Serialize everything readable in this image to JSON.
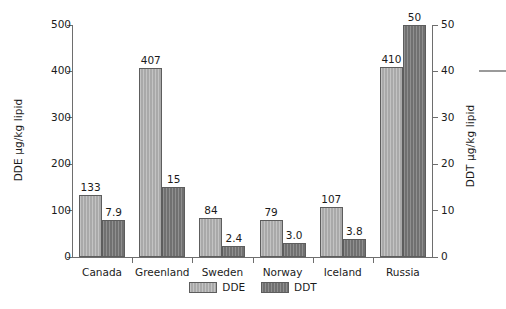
{
  "chart_data": {
    "type": "bar",
    "title": "",
    "xlabel": "",
    "categories": [
      "Canada",
      "Greenland",
      "Sweden",
      "Norway",
      "Iceland",
      "Russia"
    ],
    "series": [
      {
        "name": "DDE",
        "axis": "left",
        "color": "#a9a9a9",
        "values": [
          133,
          407,
          84,
          79,
          107,
          410
        ],
        "labels": [
          "133",
          "407",
          "84",
          "79",
          "107",
          "410"
        ]
      },
      {
        "name": "DDT",
        "axis": "right",
        "color": "#707070",
        "values": [
          7.9,
          15,
          2.4,
          3.0,
          3.8,
          50
        ],
        "labels": [
          "7.9",
          "15",
          "2.4",
          "3.0",
          "3.8",
          "50"
        ]
      }
    ],
    "left_axis": {
      "label": "DDE µg/kg lipid",
      "ticks": [
        0,
        100,
        200,
        300,
        400,
        500
      ],
      "tick_labels": [
        "0",
        "100",
        "200",
        "300",
        "400",
        "500"
      ],
      "ylim": [
        0,
        500
      ]
    },
    "right_axis": {
      "label": "DDT µg/kg lipid",
      "ticks": [
        0,
        10,
        20,
        30,
        40,
        50
      ],
      "tick_labels": [
        "0",
        "10",
        "20",
        "30",
        "40",
        "50"
      ],
      "ylim": [
        0,
        50
      ]
    },
    "legend": {
      "position": "bottom-center",
      "entries": [
        {
          "label": "DDE",
          "color": "#a9a9a9"
        },
        {
          "label": "DDT",
          "color": "#707070"
        }
      ]
    },
    "grid": false
  }
}
